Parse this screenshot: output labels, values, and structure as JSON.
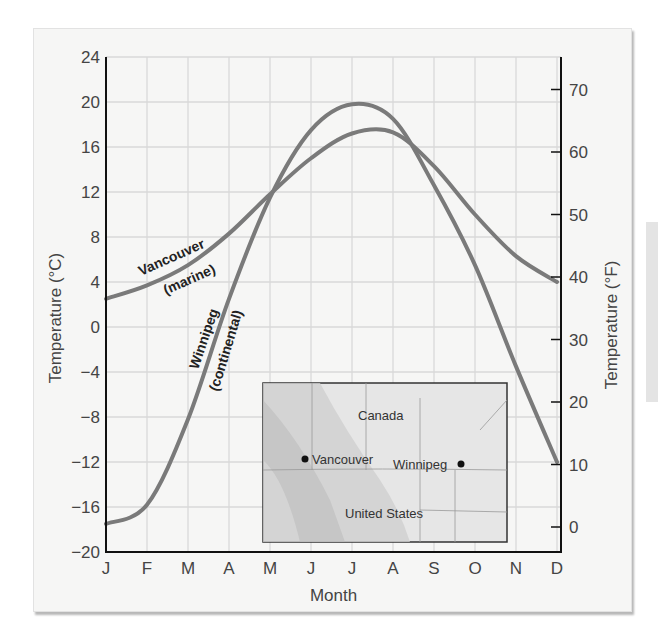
{
  "chart_data": {
    "type": "line",
    "title": "",
    "xlabel": "Month",
    "ylabel": "Temperature (°C)",
    "ylabel_right": "Temperature (°F)",
    "categories": [
      "J",
      "F",
      "M",
      "A",
      "M",
      "J",
      "J",
      "A",
      "S",
      "O",
      "N",
      "D"
    ],
    "ylim": [
      -20,
      24
    ],
    "yticks": [
      24,
      20,
      16,
      12,
      8,
      4,
      0,
      -4,
      -8,
      -12,
      -16,
      -20
    ],
    "yticks_right": [
      70,
      60,
      50,
      40,
      30,
      20,
      10,
      0
    ],
    "grid": true,
    "series": [
      {
        "name": "Vancouver (marine)",
        "label_line1": "Vancouver",
        "label_line2": "(marine)",
        "values": [
          2.5,
          3.7,
          5.5,
          8.3,
          11.8,
          15.0,
          17.2,
          17.3,
          14.3,
          10.0,
          6.3,
          4.0
        ]
      },
      {
        "name": "Winnipeg (continental)",
        "label_line1": "Winnipeg",
        "label_line2": "(continental)",
        "values": [
          -17.5,
          -15.8,
          -8.2,
          2.5,
          11.5,
          17.5,
          19.8,
          18.5,
          12.6,
          5.5,
          -3.5,
          -12.0
        ]
      }
    ],
    "inset_map": {
      "labels": {
        "country_north": "Canada",
        "country_south": "United States",
        "city1": "Vancouver",
        "city2": "Winnipeg"
      }
    }
  },
  "colors": {
    "curve": "#7a7a7a",
    "grid": "#d9d9d9",
    "axis": "#111111",
    "panel": "#f6f6f5"
  }
}
